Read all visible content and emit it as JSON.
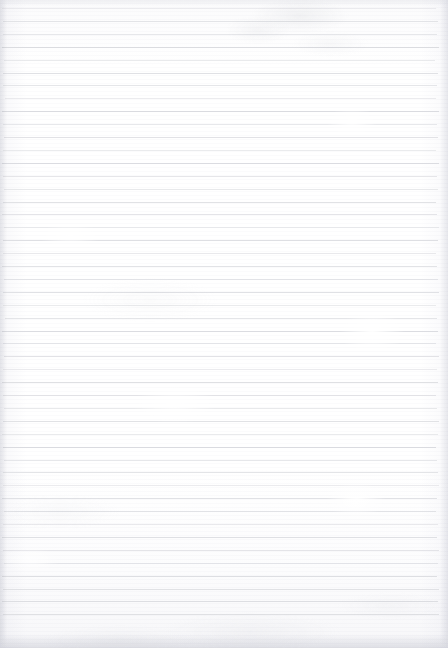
{
  "document": {
    "type": "scanned-ruled-paper",
    "title": "Blank lined notebook page",
    "text_content": "",
    "has_handwriting": false,
    "has_printed_text": false,
    "page_width_px": 448,
    "page_height_px": 648,
    "background_color": "#ffffff",
    "paper_tone_color": "#fdfdfe"
  },
  "ruling": {
    "style": "horizontal-ruled",
    "line_color": "#dcdde1",
    "line_thickness_px": 1,
    "line_spacing_px": 12.9,
    "first_line_y_px": 8,
    "last_line_y_px": 622,
    "line_count": 48,
    "left_margin_px": 3,
    "right_margin_px": 11,
    "line_left_x_px": 3,
    "line_right_x_px": 437,
    "bottom_blank_strip_px": 26,
    "has_vertical_margin_rule": false,
    "line_opacities": [
      0.55,
      0.8,
      0.7,
      0.92,
      0.62,
      0.88,
      0.74,
      0.58,
      0.95,
      0.68,
      0.84,
      0.6,
      0.9,
      0.72,
      0.66,
      0.86,
      0.78,
      0.56,
      0.93,
      0.64,
      0.82,
      0.7,
      0.88,
      0.6,
      0.76,
      0.9,
      0.68,
      0.84,
      0.58,
      0.92,
      0.72,
      0.66,
      0.86,
      0.62,
      0.94,
      0.7,
      0.8,
      0.58,
      0.88,
      0.74,
      0.64,
      0.9,
      0.78,
      0.68,
      0.96,
      0.86,
      0.98,
      0.92
    ],
    "line_inset_left": [
      2,
      3,
      3,
      2,
      4,
      3,
      3,
      5,
      2,
      3,
      4,
      3,
      2,
      3,
      4,
      3,
      2,
      4,
      3,
      3,
      2,
      4,
      3,
      3,
      5,
      2,
      3,
      4,
      3,
      2,
      3,
      4,
      3,
      2,
      3,
      4,
      3,
      3,
      2,
      4,
      3,
      2,
      3,
      4,
      2,
      3,
      2,
      3
    ],
    "line_inset_right": [
      12,
      10,
      11,
      9,
      13,
      10,
      11,
      12,
      9,
      11,
      10,
      12,
      9,
      11,
      10,
      12,
      11,
      9,
      10,
      12,
      11,
      10,
      9,
      12,
      11,
      10,
      12,
      9,
      11,
      10,
      12,
      11,
      9,
      10,
      12,
      11,
      10,
      9,
      11,
      12,
      10,
      11,
      9,
      10,
      11,
      9,
      10,
      9
    ]
  },
  "artifacts": {
    "description": "Scan artifacts only — no written or printed content",
    "smudges": [
      {
        "name": "top-center-gray-smudge",
        "x": 300,
        "y": 16
      },
      {
        "name": "top-center-gray-smudge-2",
        "x": 258,
        "y": 30
      },
      {
        "name": "top-right-gray-smudge",
        "x": 330,
        "y": 44
      },
      {
        "name": "bottom-edge-mottle",
        "x": 250,
        "y": 632
      }
    ],
    "bleached_patches": [
      {
        "name": "right-mid-bleach",
        "x": 372,
        "y": 332
      },
      {
        "name": "right-lower-bleach",
        "x": 356,
        "y": 500
      },
      {
        "name": "right-upper-bleach",
        "x": 352,
        "y": 122
      },
      {
        "name": "center-bleach",
        "x": 175,
        "y": 404
      }
    ]
  }
}
